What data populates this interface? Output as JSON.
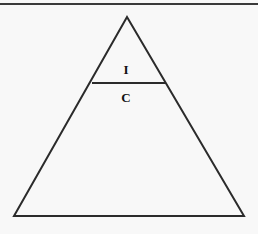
{
  "figure": {
    "background_color": "#f8f8f8",
    "stroke_color": "#2b2b2b",
    "text_color": "#111111"
  },
  "rules": {
    "top_rule": {
      "name": "top-horizontal-rule",
      "x1": 0,
      "y1": 4,
      "x2": 258,
      "y2": 4,
      "stroke_width": 2
    }
  },
  "shapes": {
    "triangle": {
      "name": "outer-triangle",
      "apex": {
        "x": 127,
        "y": 17
      },
      "bottom_left": {
        "x": 14,
        "y": 216
      },
      "bottom_right": {
        "x": 244,
        "y": 216
      },
      "stroke_width": 2,
      "fill": "none"
    },
    "divider": {
      "name": "tier-divider-line",
      "x1": 92,
      "y1": 83,
      "x2": 166,
      "y2": 83,
      "stroke_width": 2
    }
  },
  "labels": [
    {
      "id": "I",
      "text": "I",
      "x": 126,
      "y": 69,
      "tier": "upper"
    },
    {
      "id": "C",
      "text": "C",
      "x": 126,
      "y": 97,
      "tier": "middle"
    }
  ]
}
